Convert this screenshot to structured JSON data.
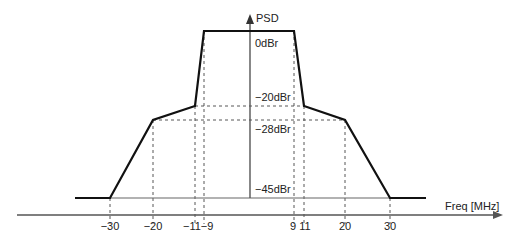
{
  "diagram": {
    "y_axis_label": "PSD",
    "x_axis_label": "Freq [MHz]",
    "level_labels": [
      {
        "text": "0dBr",
        "x": 255,
        "y": 47
      },
      {
        "text": "−20dBr",
        "x": 255,
        "y": 101
      },
      {
        "text": "−28dBr",
        "x": 255,
        "y": 133
      },
      {
        "text": "−45dBr",
        "x": 255,
        "y": 193
      }
    ],
    "freq_ticks": [
      {
        "text": "−30",
        "x": 110
      },
      {
        "text": "−20",
        "x": 153
      },
      {
        "text": "−11",
        "x": 195
      },
      {
        "text": "−9",
        "x": 204
      },
      {
        "text": "9",
        "x": 294
      },
      {
        "text": "11",
        "x": 304
      },
      {
        "text": "20",
        "x": 345
      },
      {
        "text": "30",
        "x": 390
      }
    ],
    "mask_points": [
      {
        "freq": -30,
        "dbr": -45
      },
      {
        "freq": -20,
        "dbr": -28
      },
      {
        "freq": -11,
        "dbr": -20
      },
      {
        "freq": -9,
        "dbr": 0
      },
      {
        "freq": 9,
        "dbr": 0
      },
      {
        "freq": 11,
        "dbr": -20
      },
      {
        "freq": 20,
        "dbr": -28
      },
      {
        "freq": 30,
        "dbr": -45
      }
    ],
    "colors": {
      "mask": "#111111",
      "axis": "#555555",
      "background": "#ffffff"
    }
  }
}
